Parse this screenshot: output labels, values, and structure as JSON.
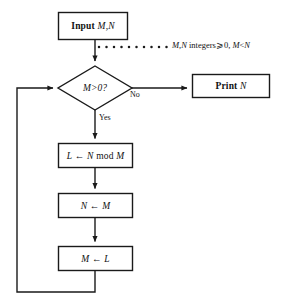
{
  "diagram": {
    "type": "flowchart",
    "background_color": "#ffffff",
    "line_color": "#1a1a1a"
  },
  "nodes": {
    "input": {
      "shape": "rectangle",
      "keyword": "Input",
      "operand": "M,N"
    },
    "decision": {
      "shape": "diamond",
      "text": "M>0?",
      "lhs": "M",
      "operator": ">",
      "rhs": "0?"
    },
    "print": {
      "shape": "rectangle",
      "keyword": "Print",
      "operand": "N"
    },
    "assign_l": {
      "shape": "rectangle",
      "target": "L",
      "arrow": "←",
      "expression_lhs": "N",
      "expression_op": "mod",
      "expression_rhs": "M"
    },
    "assign_n": {
      "shape": "rectangle",
      "target": "N",
      "arrow": "←",
      "source": "M"
    },
    "assign_m": {
      "shape": "rectangle",
      "target": "M",
      "arrow": "←",
      "source": "L"
    }
  },
  "edges": {
    "no_label": "No",
    "yes_label": "Yes"
  },
  "annotation": {
    "vars": "M,N",
    "text": " integers",
    "condition": "⩾0, ",
    "constraint_lhs": "M",
    "constraint_op": "<",
    "constraint_rhs": "N"
  }
}
